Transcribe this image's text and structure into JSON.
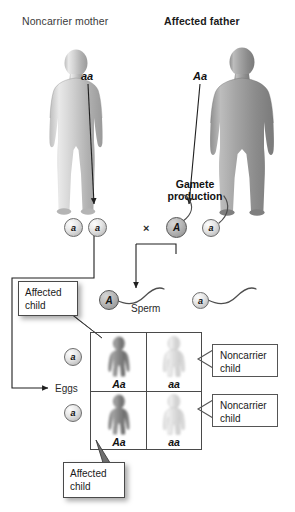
{
  "figure": {
    "type": "genetics-punnett-diagram",
    "parents": [
      {
        "id": "mother",
        "title": "Noncarrier mother",
        "title_bold": false,
        "genotype": "aa",
        "sex": "female"
      },
      {
        "id": "father",
        "title": "Affected father",
        "title_bold": true,
        "genotype": "Aa",
        "sex": "male"
      }
    ],
    "gamete_section": {
      "title_line1": "Gamete",
      "title_line2": "production",
      "cross_symbol": "×",
      "mother_gametes": [
        {
          "allele": "a",
          "shade": "light"
        },
        {
          "allele": "a",
          "shade": "light"
        }
      ],
      "father_gametes": [
        {
          "allele": "A",
          "shade": "dark"
        },
        {
          "allele": "a",
          "shade": "light"
        }
      ]
    },
    "sperm_row": {
      "label": "Sperm",
      "gametes": [
        {
          "allele": "A",
          "shade": "dark"
        },
        {
          "allele": "a",
          "shade": "light"
        }
      ]
    },
    "eggs_axis": {
      "label": "Eggs",
      "gametes": [
        {
          "allele": "a",
          "shade": "light"
        },
        {
          "allele": "a",
          "shade": "light"
        }
      ]
    },
    "punnett": {
      "rows": [
        {
          "cells": [
            {
              "genotype": "Aa",
              "phenotype": "affected",
              "shade": "dark"
            },
            {
              "genotype": "aa",
              "phenotype": "noncarrier",
              "shade": "light"
            }
          ]
        },
        {
          "cells": [
            {
              "genotype": "Aa",
              "phenotype": "affected",
              "shade": "dark"
            },
            {
              "genotype": "aa",
              "phenotype": "noncarrier",
              "shade": "light"
            }
          ]
        }
      ]
    },
    "callouts": [
      {
        "id": "affected-top",
        "line1": "Affected",
        "line2": "child",
        "style": "shadow"
      },
      {
        "id": "noncarrier-top",
        "line1": "Noncarrier",
        "line2": "child",
        "style": "plain"
      },
      {
        "id": "noncarrier-bot",
        "line1": "Noncarrier",
        "line2": "child",
        "style": "plain"
      },
      {
        "id": "affected-bottom",
        "line1": "Affected",
        "line2": "child",
        "style": "shadow"
      }
    ],
    "colors": {
      "background": "#ffffff",
      "line": "#4a4a4a",
      "text": "#1a1a1a",
      "body_light": "#c9c9c9",
      "body_dark": "#8d8d8d"
    }
  }
}
